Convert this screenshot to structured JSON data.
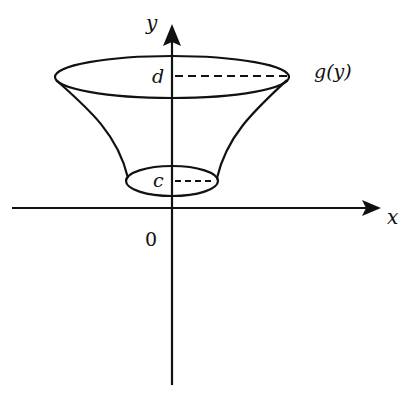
{
  "diagram": {
    "type": "solid of revolution about y-axis",
    "labels": {
      "y_axis": "y",
      "x_axis": "x",
      "origin": "0",
      "upper_bound": "d",
      "lower_bound": "c",
      "curve": "g(y)"
    },
    "colors": {
      "stroke": "#111111",
      "background": "#ffffff"
    }
  }
}
